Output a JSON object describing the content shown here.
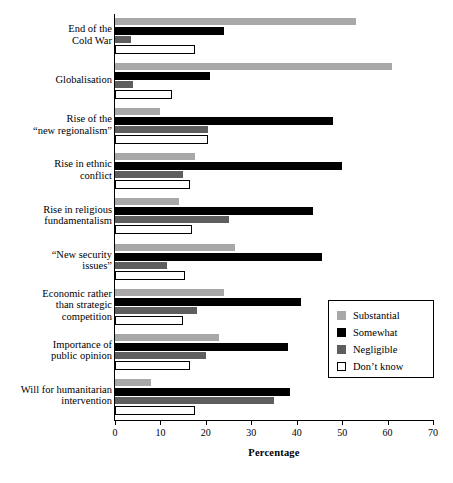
{
  "chart_data": {
    "type": "bar",
    "orientation": "horizontal",
    "title": "",
    "xlabel": "Percentage",
    "ylabel": "",
    "xlim": [
      0,
      70
    ],
    "xticks": [
      0,
      10,
      20,
      30,
      40,
      50,
      60,
      70
    ],
    "grid": false,
    "legend_position": "right-lower",
    "categories": [
      "End of the\nCold War",
      "Globalisation",
      "Rise of the\n“new regionalism”",
      "Rise in ethnic\nconflict",
      "Rise in religious\nfundamentalism",
      "“New security\nissues”",
      "Economic rather\nthan strategic\ncompetition",
      "Importance of\npublic opinion",
      "Will for humanitarian\nintervention"
    ],
    "series": [
      {
        "name": "Substantial",
        "color": "#a8a8a8",
        "values": [
          53,
          61,
          10,
          17.5,
          14,
          26.5,
          24,
          23,
          8
        ]
      },
      {
        "name": "Somewhat",
        "color": "#000000",
        "values": [
          24,
          21,
          48,
          50,
          43.5,
          45.5,
          41,
          38,
          38.5
        ]
      },
      {
        "name": "Negligible",
        "color": "#5e5e5e",
        "values": [
          3.5,
          4,
          20.5,
          15,
          25,
          11.5,
          18,
          20,
          35
        ]
      },
      {
        "name": "Don't know",
        "color": "#ffffff",
        "values": [
          17.5,
          12.5,
          20.5,
          16.5,
          17,
          15.5,
          15,
          16.5,
          17.5
        ]
      }
    ]
  },
  "legend": {
    "items": [
      {
        "label": "Substantial",
        "swatch": "sw-substantial"
      },
      {
        "label": "Somewhat",
        "swatch": "sw-somewhat"
      },
      {
        "label": "Negligible",
        "swatch": "sw-negligible"
      },
      {
        "label": "Don’t know",
        "swatch": "sw-dontknow"
      }
    ]
  }
}
